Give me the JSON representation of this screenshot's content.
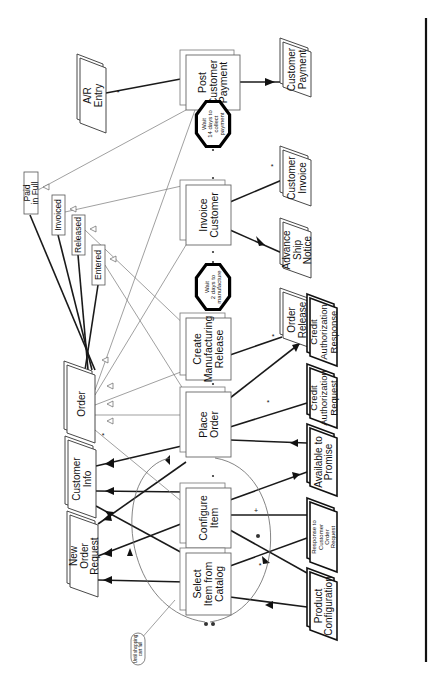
{
  "diagram": {
    "orientation": "rotated-90-ccw",
    "processes": [
      {
        "id": "post-customer-payment",
        "lines": [
          "Post",
          "Customer",
          "Payment"
        ]
      },
      {
        "id": "invoice-customer",
        "lines": [
          "Invoice",
          "Customer"
        ]
      },
      {
        "id": "create-manufacturing-release",
        "lines": [
          "Create",
          "Manufacturing",
          "Release"
        ]
      },
      {
        "id": "place-order",
        "lines": [
          "Place",
          "Order"
        ]
      },
      {
        "id": "configure-item",
        "lines": [
          "Configure",
          "Item"
        ]
      },
      {
        "id": "select-item-from-catalog",
        "lines": [
          "Select",
          "Item from",
          "Catalog"
        ]
      }
    ],
    "waits": [
      {
        "id": "wait-collect",
        "lines": [
          "Wait",
          "14 days to",
          "collect",
          "payment"
        ]
      },
      {
        "id": "wait-manufacture",
        "lines": [
          "Wait",
          "2 days to",
          "manufacture"
        ]
      }
    ],
    "documents_right": [
      {
        "id": "customer-payment",
        "lines": [
          "Customer",
          "Payment"
        ]
      },
      {
        "id": "customer-invoice",
        "lines": [
          "Customer",
          "Invoice"
        ]
      },
      {
        "id": "advance-ship-notice",
        "lines": [
          "Advance",
          "Ship",
          "Notice"
        ]
      },
      {
        "id": "order-release",
        "lines": [
          "Order",
          "Release"
        ]
      },
      {
        "id": "credit-authorization-response",
        "lines": [
          "Credit",
          "Authorization",
          "Response"
        ]
      },
      {
        "id": "credit-authorization-request",
        "lines": [
          "Credit",
          "Authorization",
          "Request"
        ]
      },
      {
        "id": "available-to-promise",
        "lines": [
          "Available to",
          "Promise"
        ]
      },
      {
        "id": "response-to-customer-order-request",
        "lines": [
          "Response to",
          "Customer",
          "Order",
          "Request"
        ]
      },
      {
        "id": "product-configuration",
        "lines": [
          "Product",
          "Configuration"
        ]
      }
    ],
    "documents_left": [
      {
        "id": "ar-entry",
        "lines": [
          "A/R",
          "Entry"
        ]
      },
      {
        "id": "order",
        "lines": [
          "Order"
        ]
      },
      {
        "id": "customer-info",
        "lines": [
          "Customer",
          "Info"
        ]
      },
      {
        "id": "new-order-request",
        "lines": [
          "New",
          "Order",
          "Request"
        ]
      }
    ],
    "order_states": [
      {
        "id": "paid-in-full",
        "lines": [
          "Paid",
          "in Full"
        ]
      },
      {
        "id": "invoiced",
        "lines": [
          "Invoiced"
        ]
      },
      {
        "id": "released",
        "lines": [
          "Released"
        ]
      },
      {
        "id": "entered",
        "lines": [
          "Entered"
        ]
      }
    ],
    "loop_annotation": {
      "lines": [
        "Until shopping",
        "cart full"
      ]
    },
    "multiplicity_marks": {
      "many": "*",
      "one": "+"
    }
  }
}
